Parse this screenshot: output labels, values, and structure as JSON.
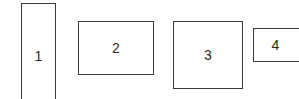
{
  "diagram": {
    "boxes": [
      {
        "id": 1,
        "label": "1"
      },
      {
        "id": 2,
        "label": "2"
      },
      {
        "id": 3,
        "label": "3"
      },
      {
        "id": 4,
        "label": "4"
      }
    ],
    "colors": {
      "border": "#3a3a3a",
      "text": "#2a2a2a",
      "background": "#ffffff"
    }
  }
}
